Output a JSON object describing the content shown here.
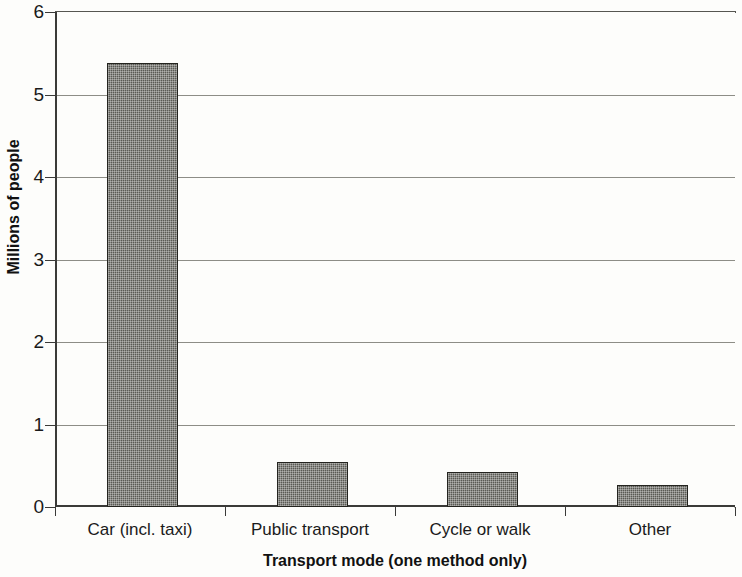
{
  "chart_data": {
    "type": "bar",
    "title": "",
    "categories": [
      "Car (incl. taxi)",
      "Public transport",
      "Cycle or walk",
      "Other"
    ],
    "values": [
      5.38,
      0.54,
      0.42,
      0.27
    ],
    "series": [
      {
        "name": "Millions of people",
        "values": [
          5.38,
          0.54,
          0.42,
          0.27
        ]
      }
    ],
    "xlabel": "Transport mode (one method only)",
    "ylabel": "Millions of people",
    "ylim": [
      0,
      6
    ],
    "yticks": [
      0,
      1,
      2,
      3,
      4,
      5,
      6
    ],
    "ytick_labels": [
      "0",
      "1",
      "2",
      "3",
      "4",
      "5",
      "6"
    ],
    "grid": "horizontal",
    "legend": "none",
    "bar_color": "#5a5a54",
    "bar_edge_color": "#24241f",
    "axis_color": "#3a3a38",
    "gridline_color": "#8d8d86",
    "background_color": "#fdfdfb"
  }
}
